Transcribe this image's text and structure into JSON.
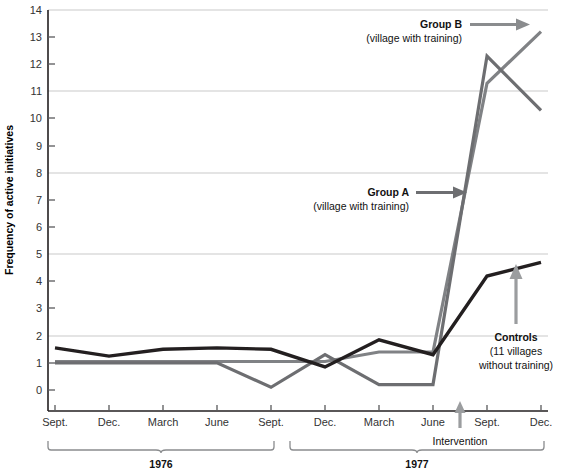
{
  "chart_data": {
    "type": "line",
    "title": "",
    "xlabel": "",
    "ylabel": "Frequency of active initiatives",
    "ylim": [
      0,
      14
    ],
    "yticks": [
      0,
      1,
      2,
      3,
      4,
      5,
      6,
      7,
      8,
      9,
      10,
      11,
      12,
      13,
      14
    ],
    "gridlines": [
      2,
      5,
      8,
      11,
      14
    ],
    "grid": true,
    "legend_position": "inline-annotations",
    "categories": [
      "Sept.",
      "Dec.",
      "March",
      "June",
      "Sept.",
      "Dec.",
      "March",
      "June",
      "Sept.",
      "Dec."
    ],
    "period_labels": [
      "1976",
      "1977"
    ],
    "series": [
      {
        "name": "Group A",
        "sublabel": "(village with training)",
        "color": "#6d6e71",
        "values": [
          1.0,
          1.0,
          1.0,
          1.0,
          0.1,
          1.3,
          0.2,
          0.2,
          12.3,
          10.3
        ]
      },
      {
        "name": "Group B",
        "sublabel": "(village with training)",
        "color": "#808285",
        "values": [
          1.05,
          1.05,
          1.05,
          1.05,
          1.05,
          1.05,
          1.4,
          1.4,
          11.3,
          13.2
        ]
      },
      {
        "name": "Controls",
        "sublabel_line1": "(11 villages",
        "sublabel_line2": "without training)",
        "color": "#231f20",
        "values": [
          1.55,
          1.25,
          1.5,
          1.55,
          1.5,
          0.85,
          1.85,
          1.3,
          4.2,
          4.7
        ]
      }
    ],
    "annotations": [
      {
        "id": "group-b",
        "label": "Group B",
        "sub": "(village with training)"
      },
      {
        "id": "group-a",
        "label": "Group A",
        "sub": "(village with training)"
      },
      {
        "id": "controls",
        "label": "Controls",
        "sub1": "(11 villages",
        "sub2": "without training)"
      },
      {
        "id": "intervention",
        "label": "Intervention"
      }
    ]
  },
  "axis": {
    "y_axis_title": "Frequency of active initiatives",
    "y_tick_14": "14",
    "y_tick_13": "13",
    "y_tick_12": "12",
    "y_tick_11": "11",
    "y_tick_10": "10",
    "y_tick_9": "9",
    "y_tick_8": "8",
    "y_tick_7": "7",
    "y_tick_6": "6",
    "y_tick_5": "5",
    "y_tick_4": "4",
    "y_tick_3": "3",
    "y_tick_2": "2",
    "y_tick_1": "1",
    "y_tick_0": "0",
    "x_tick_0": "Sept.",
    "x_tick_1": "Dec.",
    "x_tick_2": "March",
    "x_tick_3": "June",
    "x_tick_4": "Sept.",
    "x_tick_5": "Dec.",
    "x_tick_6": "March",
    "x_tick_7": "June",
    "x_tick_8": "Sept.",
    "x_tick_9": "Dec."
  },
  "annotations": {
    "group_b_title": "Group B",
    "group_b_sub": "(village with training)",
    "group_a_title": "Group A",
    "group_a_sub": "(village with training)",
    "controls_title": "Controls",
    "controls_sub1": "(11 villages",
    "controls_sub2": "without training)",
    "intervention": "Intervention",
    "year_1976": "1976",
    "year_1977": "1977"
  },
  "colors": {
    "group_a": "#6d6e71",
    "group_b": "#808285",
    "controls": "#231f20",
    "grid": "#c9c9c9",
    "axis": "#231f20",
    "arrow": "#808285"
  }
}
